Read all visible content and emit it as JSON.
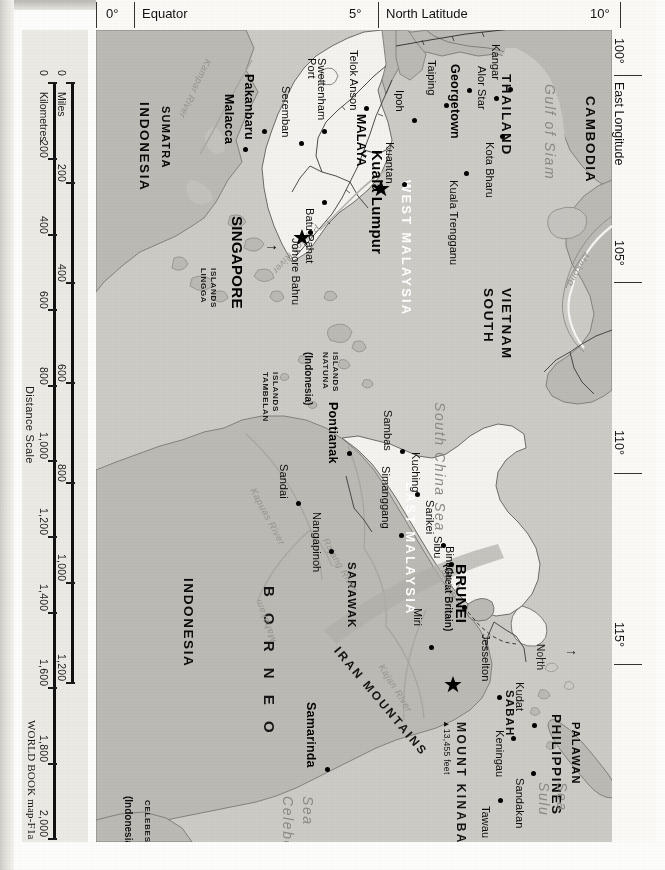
{
  "map": {
    "title": "Malaysia and Southeast Asia reference map",
    "credit": "WORLD BOOK map-F1a",
    "orientation_note": "North",
    "north_arrow": "→"
  },
  "margins": {
    "top_axis": [
      {
        "tick": "0°",
        "name": "Equator"
      },
      {
        "tick": "5°",
        "name": "North Latitude"
      },
      {
        "tick": "10°",
        "name": ""
      }
    ],
    "right_axis": [
      {
        "tick": "100°",
        "name": "East Longitude"
      },
      {
        "tick": "105°",
        "name": ""
      },
      {
        "tick": "110°",
        "name": ""
      },
      {
        "tick": "115°",
        "name": ""
      }
    ]
  },
  "scale": {
    "title": "Distance Scale",
    "miles_unit": "Miles",
    "km_unit": "Kilometres",
    "miles_ticks": [
      "0",
      "200",
      "400",
      "600",
      "800",
      "1,000",
      "1,200"
    ],
    "km_ticks": [
      "0",
      "200",
      "400",
      "600",
      "800",
      "1,000",
      "1,200",
      "1,400",
      "1,600",
      "1,800",
      "2,000"
    ]
  },
  "countries": [
    {
      "label": "THAILAND"
    },
    {
      "label": "CAMBODIA"
    },
    {
      "label": "SOUTH\nVIETNAM"
    },
    {
      "label": "PHILIPPINES"
    },
    {
      "label": "INDONESIA"
    },
    {
      "label": "MALAYA"
    },
    {
      "label": "SINGAPORE"
    },
    {
      "label": "BRUNEI"
    }
  ],
  "labels": {
    "thailand": "THAILAND",
    "cambodia": "CAMBODIA",
    "south_vietnam_1": "SOUTH",
    "south_vietnam_2": "VIETNAM",
    "philippines": "PHILIPPINES",
    "palawan": "PALAWAN",
    "indonesia_sumatra": "INDONESIA",
    "sumatra": "SUMATRA",
    "indonesia_borneo": "INDONESIA",
    "malaya": "MALAYA",
    "singapore": "SINGAPORE",
    "brunei": "BRUNEI",
    "brunei_sub": "(Great Britain)",
    "west_malaysia": "WEST MALAYSIA",
    "east_malaysia": "EAST MALAYSIA",
    "sarawak": "SARAWAK",
    "sabah": "SABAH",
    "borneo": "B O R N E O",
    "iran_mountains": "IRAN MOUNTAINS",
    "mount_kinabalu": "MOUNT KINABALU",
    "kinabalu_elev": "▲13,455 feet",
    "lingga_1": "LINGGA",
    "lingga_2": "ISLANDS",
    "natuna_1": "NATUNA",
    "natuna_2": "ISLANDS",
    "natuna_3": "(Indonesia)",
    "tambelan_1": "TAMBELAN",
    "tambelan_2": "ISLANDS",
    "celebes_1": "CELEBES",
    "celebes_2": "(Indonesia)"
  },
  "waters": {
    "south_china_sea": "South China Sea",
    "gulf_of_siam": "Gulf of Siam",
    "sulu_sea_1": "Sulu",
    "sulu_sea_2": "Sea",
    "celebes_sea_1": "Celebes",
    "celebes_sea_2": "Sea"
  },
  "rivers": [
    {
      "name": "Kampar River"
    },
    {
      "name": "Pahang River"
    },
    {
      "name": "Mekong"
    },
    {
      "name": "Kapuas River"
    },
    {
      "name": "Rajang River"
    },
    {
      "name": "Kajan River"
    },
    {
      "name": "Mahakam"
    },
    {
      "name": "Baram"
    }
  ],
  "river_labels": {
    "kampar": "Kampar River",
    "pahang": "Pahang River",
    "mekong": "Mekong",
    "kapuas": "Kapuas River",
    "rajang": "Rajang River",
    "kajan": "Kajan River",
    "mahakam": "Mahakam",
    "baram": "Baram"
  },
  "capitals": [
    {
      "name": "Kuala Lumpur",
      "symbol": "star"
    },
    {
      "name": "Singapore",
      "symbol": "star"
    },
    {
      "name": "Saigon",
      "symbol": "star"
    },
    {
      "name": "Brunei",
      "symbol": "star"
    }
  ],
  "cities": [
    {
      "name": "Pakanbaru"
    },
    {
      "name": "Malacca"
    },
    {
      "name": "Seremban"
    },
    {
      "name": "Port Swettenham"
    },
    {
      "name": "Telok Anson"
    },
    {
      "name": "Ipoh"
    },
    {
      "name": "Taiping"
    },
    {
      "name": "Georgetown"
    },
    {
      "name": "Alor Star"
    },
    {
      "name": "Kangar"
    },
    {
      "name": "Kota Bharu"
    },
    {
      "name": "Kuala Trengganu"
    },
    {
      "name": "Kuantan"
    },
    {
      "name": "Batu Pahat"
    },
    {
      "name": "Johore Bahru"
    },
    {
      "name": "Kuala Lumpur"
    },
    {
      "name": "Saigon"
    },
    {
      "name": "Pontianak"
    },
    {
      "name": "Sambas"
    },
    {
      "name": "Simanggang"
    },
    {
      "name": "Kuching"
    },
    {
      "name": "Sarikei"
    },
    {
      "name": "Sibu"
    },
    {
      "name": "Bintulu"
    },
    {
      "name": "Miri"
    },
    {
      "name": "Sandai"
    },
    {
      "name": "Nangapinoh"
    },
    {
      "name": "Samarinda"
    },
    {
      "name": "Jesselton"
    },
    {
      "name": "Kudat"
    },
    {
      "name": "Keningau"
    },
    {
      "name": "Sandakan"
    },
    {
      "name": "Tawau"
    }
  ],
  "city_labels": {
    "pakanbaru": "Pakanbaru",
    "malacca": "Malacca",
    "seremban": "Seremban",
    "port": "Port",
    "swettenham": "Swettenham",
    "telok_anson": "Telok Anson",
    "ipoh": "Ipoh",
    "taiping": "Taiping",
    "georgetown": "Georgetown",
    "alor_star": "Alor Star",
    "kangar": "Kangar",
    "kota_bharu": "Kota Bharu",
    "kuala_trengganu": "Kuala Trengganu",
    "kuantan": "Kuantan",
    "batu_pahat": "Batu Pahat",
    "johore_bahru": "Johore Bahru",
    "kuala_lumpur": "Kuala Lumpur",
    "saigon": "Saigon",
    "pontianak": "Pontianak",
    "sambas": "Sambas",
    "simanggang": "Simanggang",
    "kuching": "Kuching",
    "sarikei": "Sarikei",
    "sibu": "Sibu",
    "bintulu": "Bintulu",
    "miri": "Miri",
    "sandai": "Sandai",
    "nangapinoh": "Nangapinoh",
    "samarinda": "Samarinda",
    "jesselton": "Jesselton",
    "kudat": "Kudat",
    "keningau": "Keningau",
    "sandakan": "Sandakan",
    "tawau": "Tawau"
  },
  "colors": {
    "sea": "#cdcbc6",
    "land_other": "#bcbab4",
    "land_malaysia": "#f4f3ef",
    "border": "#6e6c67",
    "text": "#111111",
    "water_text": "#8c8a85",
    "panel": "#eceae4"
  }
}
